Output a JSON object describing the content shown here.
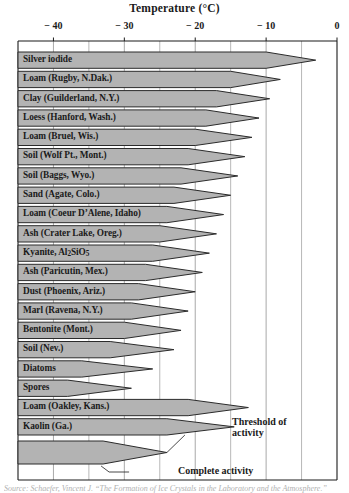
{
  "chart_data": {
    "type": "bar",
    "title": "Temperature (°C)",
    "xlabel": "Temperature (°C)",
    "ylabel": "",
    "xlim": [
      -45,
      0
    ],
    "grid": true,
    "grid_interval": 5,
    "tick_values": [
      -40,
      -30,
      -20,
      -10,
      0
    ],
    "tick_labels": [
      "− 40",
      "− 30",
      "− 20",
      "− 10",
      "0"
    ],
    "orientation": "horizontal",
    "value_unit": "°C",
    "categories": [
      "Silver iodide",
      "Loam (Rugby, N.Dak.)",
      "Clay (Guilderland, N.Y.)",
      "Loess (Hanford, Wash.)",
      "Loam (Bruel, Wis.)",
      "Soil (Wolf Pt., Mont.)",
      "Soil (Baggs, Wyo.)",
      "Sand (Agate, Colo.)",
      "Loam (Coeur D’Alene, Idaho)",
      "Ash (Crater Lake, Oreg.)",
      "Kyanite, Al2SiO5",
      "Ash (Paricutin, Mex.)",
      "Dust (Phoenix, Ariz.)",
      "Marl (Ravena, N.Y.)",
      "Bentonite (Mont.)",
      "Soil (Nev.)",
      "Diatoms",
      "Spores",
      "Loam (Oakley, Kans.)",
      "Kaolin (Ga.)",
      "Summary"
    ],
    "series": [
      {
        "name": "Threshold of activity",
        "values": [
          -3.0,
          -8.0,
          -9.5,
          -11.0,
          -12.0,
          -13.0,
          -14.0,
          -15.0,
          -16.0,
          -17.0,
          -18.0,
          -19.0,
          -20.0,
          -21.0,
          -22.0,
          -23.0,
          -26.0,
          -29.0,
          -12.5,
          -14.5,
          -24.0
        ]
      },
      {
        "name": "Complete activity",
        "values": [
          -10.0,
          -15.0,
          -17.0,
          -18.5,
          -20.0,
          -21.0,
          -22.0,
          -23.0,
          -24.0,
          -25.0,
          -26.0,
          -27.0,
          -28.0,
          -29.0,
          -30.0,
          -32.0,
          -36.0,
          -38.0,
          -21.0,
          -24.0,
          -33.0
        ]
      }
    ],
    "annotations": [
      {
        "label": "Threshold of activity",
        "target_value": -11.0
      },
      {
        "label": "Complete activity",
        "target_value": -17.5
      }
    ]
  },
  "rows": [
    {
      "label": "Silver iodide",
      "threshold": -3.0,
      "complete": -10.0
    },
    {
      "label": "Loam (Rugby, N.Dak.)",
      "threshold": -8.0,
      "complete": -15.0
    },
    {
      "label": "Clay (Guilderland, N.Y.)",
      "threshold": -9.5,
      "complete": -17.0
    },
    {
      "label": "Loess (Hanford, Wash.)",
      "threshold": -11.0,
      "complete": -18.5
    },
    {
      "label": "Loam (Bruel, Wis.)",
      "threshold": -12.0,
      "complete": -20.0
    },
    {
      "label": "Soil (Wolf Pt., Mont.)",
      "threshold": -13.0,
      "complete": -21.0
    },
    {
      "label": "Soil (Baggs, Wyo.)",
      "threshold": -14.0,
      "complete": -22.0
    },
    {
      "label": "Sand (Agate, Colo.)",
      "threshold": -15.0,
      "complete": -23.0
    },
    {
      "label": "Loam (Coeur D’Alene, Idaho)",
      "threshold": -16.0,
      "complete": -24.0
    },
    {
      "label": "Ash (Crater Lake, Oreg.)",
      "threshold": -17.0,
      "complete": -25.0
    },
    {
      "label": "Kyanite, Al|2|SiO|5|",
      "threshold": -18.0,
      "complete": -26.0
    },
    {
      "label": "Ash (Paricutin, Mex.)",
      "threshold": -19.0,
      "complete": -27.0
    },
    {
      "label": "Dust (Phoenix, Ariz.)",
      "threshold": -20.0,
      "complete": -28.0
    },
    {
      "label": "Marl (Ravena, N.Y.)",
      "threshold": -21.0,
      "complete": -29.0
    },
    {
      "label": "Bentonite (Mont.)",
      "threshold": -22.0,
      "complete": -30.0
    },
    {
      "label": "Soil (Nev.)",
      "threshold": -23.0,
      "complete": -32.0
    },
    {
      "label": "Diatoms",
      "threshold": -26.0,
      "complete": -36.0
    },
    {
      "label": "Spores",
      "threshold": -29.0,
      "complete": -38.0
    },
    {
      "label": "Loam (Oakley, Kans.)",
      "threshold": -12.5,
      "complete": -21.0
    },
    {
      "label": "Kaolin (Ga.)",
      "threshold": -14.5,
      "complete": -24.0
    }
  ],
  "summary_band": {
    "threshold": -24.0,
    "complete": -33.0
  },
  "annotations": {
    "threshold_line1": "Threshold of",
    "threshold_line2": "activity",
    "complete": "Complete activity"
  },
  "caption": "Source: Schaefer, Vincent J. “The Formation of Ice Crystals in the Laboratory and the Atmosphere.”",
  "colors": {
    "band_fill": "#b3b3b3",
    "band_stroke": "#2b2b2b",
    "grid": "#9a9a9a",
    "axis": "#1a1a1a",
    "text": "#1a1a1a"
  }
}
